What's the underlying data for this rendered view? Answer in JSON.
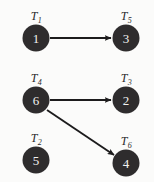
{
  "diagram": {
    "background_color": "#fbfbfa",
    "node_fill_color": "#2e2c2d",
    "node_text_color": "#f2f2f0",
    "edge_color": "#1c1b1c",
    "nodes": [
      {
        "id": "n1",
        "label": "T",
        "subscript": "1",
        "value": "1",
        "x": 36,
        "y": 38
      },
      {
        "id": "n5",
        "label": "T",
        "subscript": "5",
        "value": "3",
        "x": 126,
        "y": 38
      },
      {
        "id": "n4",
        "label": "T",
        "subscript": "4",
        "value": "6",
        "x": 36,
        "y": 100
      },
      {
        "id": "n3",
        "label": "T",
        "subscript": "3",
        "value": "2",
        "x": 126,
        "y": 100
      },
      {
        "id": "n2",
        "label": "T",
        "subscript": "2",
        "value": "5",
        "x": 36,
        "y": 160
      },
      {
        "id": "n6",
        "label": "T",
        "subscript": "6",
        "value": "4",
        "x": 126,
        "y": 163
      }
    ],
    "edges": [
      {
        "id": "e1",
        "from": "n1",
        "to": "n5",
        "directed": "true",
        "x1": 50,
        "y1": 38,
        "x2": 111,
        "y2": 38
      },
      {
        "id": "e2",
        "from": "n4",
        "to": "n3",
        "directed": "true",
        "x1": 50,
        "y1": 100,
        "x2": 111,
        "y2": 100
      },
      {
        "id": "e3",
        "from": "n4",
        "to": "n6",
        "directed": "true",
        "x1": 47,
        "y1": 110,
        "x2": 115,
        "y2": 156
      }
    ]
  }
}
